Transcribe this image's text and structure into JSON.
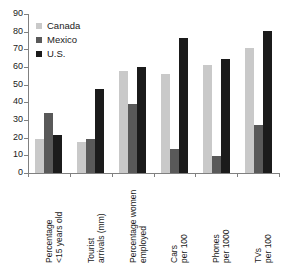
{
  "chart_data": {
    "type": "bar",
    "title": "",
    "xlabel": "",
    "ylabel": "",
    "ylim": [
      0,
      90
    ],
    "yticks": [
      0,
      10,
      20,
      30,
      40,
      50,
      60,
      70,
      80,
      90
    ],
    "grid": false,
    "legend_position": "top-left",
    "categories": [
      "Percentage\n<15 years old",
      "Tourist\narrivals (mm)",
      "Percentage women\nemployed",
      "Cars\nper 100",
      "Phones\nper 1000",
      "TVs\nper 100"
    ],
    "category_lines": [
      [
        "Percentage",
        "<15 years old"
      ],
      [
        "Tourist",
        "arrivals (mm)"
      ],
      [
        "Percentage women",
        "employed"
      ],
      [
        "Cars",
        "per 100"
      ],
      [
        "Phones",
        "per 1000"
      ],
      [
        "TVs",
        "per 100"
      ]
    ],
    "series": [
      {
        "name": "Canada",
        "color": "#c9c9c9",
        "values": [
          19,
          17.5,
          57.5,
          56,
          61,
          70.5
        ]
      },
      {
        "name": "Mexico",
        "color": "#595959",
        "values": [
          34,
          19,
          39,
          13.5,
          9.5,
          27
        ]
      },
      {
        "name": "U.S.",
        "color": "#1b1b1b",
        "values": [
          21.5,
          47.5,
          60,
          76.5,
          64.5,
          80.5
        ]
      }
    ]
  },
  "legend": {
    "items": [
      {
        "label": "Canada",
        "color": "#c9c9c9"
      },
      {
        "label": "Mexico",
        "color": "#595959"
      },
      {
        "label": "U.S.",
        "color": "#1b1b1b"
      }
    ]
  }
}
